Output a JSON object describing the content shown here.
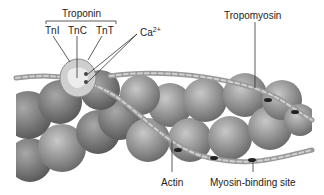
{
  "figure": {
    "labels": {
      "troponin": "Troponin",
      "tni": "TnI",
      "tnc": "TnC",
      "tnt": "TnT",
      "calcium": "Ca",
      "calcium_charge": "2+",
      "tropomyosin": "Tropomyosin",
      "actin": "Actin",
      "myosin_binding_site": "Myosin-binding site"
    },
    "colors": {
      "actin_fill": "#8a8a8a",
      "actin_highlight": "#c4c4c4",
      "troponin_fill": "#d0d0d0",
      "tropomyosin": "#b5b5b5",
      "line": "#333333"
    }
  }
}
